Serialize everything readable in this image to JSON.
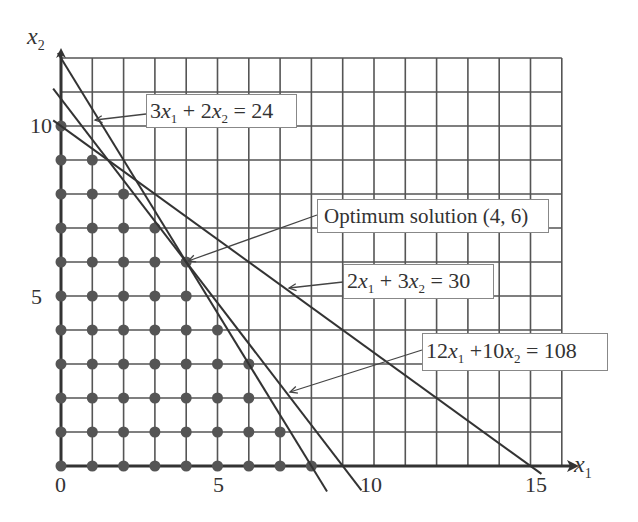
{
  "chart_data": {
    "type": "diagram",
    "title": "",
    "xlabel": "x1",
    "ylabel": "x2",
    "xlim": [
      0,
      16
    ],
    "ylim": [
      0,
      12
    ],
    "grid": true,
    "x_ticks": [
      0,
      5,
      10,
      15
    ],
    "y_ticks": [
      5,
      10
    ],
    "constraints": [
      {
        "label": "3x1 + 2x2 = 24",
        "a": 3,
        "b": 2,
        "c": 24
      },
      {
        "label": "2x1 + 3x2 = 30",
        "a": 2,
        "b": 3,
        "c": 30
      },
      {
        "label": "12x1 + 10x2 = 108",
        "a": 12,
        "b": 10,
        "c": 108
      }
    ],
    "optimum": {
      "label": "Optimum solution (4, 6)",
      "x1": 4,
      "x2": 6
    },
    "feasible_integer_points_by_row": [
      {
        "x2": 0,
        "x1_max": 8
      },
      {
        "x2": 1,
        "x1_max": 7
      },
      {
        "x2": 2,
        "x1_max": 6
      },
      {
        "x2": 3,
        "x1_max": 6
      },
      {
        "x2": 4,
        "x1_max": 5
      },
      {
        "x2": 5,
        "x1_max": 4
      },
      {
        "x2": 6,
        "x1_max": 4
      },
      {
        "x2": 7,
        "x1_max": 3
      },
      {
        "x2": 8,
        "x1_max": 2
      },
      {
        "x2": 9,
        "x1_max": 1
      },
      {
        "x2": 10,
        "x1_max": 0
      }
    ]
  },
  "axes": {
    "x_name": "x",
    "x_sub": "1",
    "y_name": "x",
    "y_sub": "2",
    "ticks": {
      "x0": "0",
      "x5": "5",
      "x10": "10",
      "x15": "15",
      "y5": "5",
      "y10": "10"
    }
  },
  "labels": {
    "c1": {
      "coef1": "3",
      "var1": "x",
      "sub1": "1",
      "op": " + ",
      "coef2": "2",
      "var2": "x",
      "sub2": "2",
      "rhs": " = 24"
    },
    "opt": {
      "text": "Optimum solution (4, 6)"
    },
    "c2": {
      "coef1": "2",
      "var1": "x",
      "sub1": "1",
      "op": " + ",
      "coef2": "3",
      "var2": "x",
      "sub2": "2",
      "rhs": " = 30"
    },
    "c3": {
      "coef1": "12",
      "var1": "x",
      "sub1": "1",
      "op": " +",
      "coef2": "10",
      "var2": "x",
      "sub2": "2",
      "rhs": " = 108"
    }
  },
  "colors": {
    "grid": "#444444",
    "line": "#333333",
    "dot": "#555555",
    "text": "#333333"
  }
}
